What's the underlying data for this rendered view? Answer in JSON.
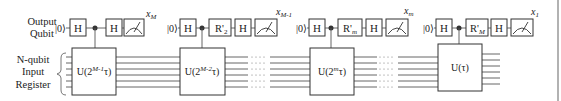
{
  "labels": {
    "output_qubit_line1": "Output",
    "output_qubit_line2": "Qubit",
    "register_line1": "N-qubit",
    "register_line2": "Input",
    "register_line3": "Register"
  },
  "stages": [
    {
      "ket": "|0⟩",
      "h1": "H",
      "rotation": "",
      "h2": "H",
      "unitary_base": "U(2",
      "unitary_exp": "M-1",
      "unitary_tail": "τ)",
      "measure_label": "x",
      "measure_sub": "M"
    },
    {
      "ket": "|0⟩",
      "h1": "H",
      "rotation": "R'",
      "rotation_sub": "2",
      "h2": "H",
      "unitary_base": "U(2",
      "unitary_exp": "M-2",
      "unitary_tail": "τ)",
      "measure_label": "x",
      "measure_sub": "M-1"
    },
    {
      "ket": "|0⟩",
      "h1": "H",
      "rotation": "R'",
      "rotation_sub": "m",
      "h2": "H",
      "unitary_base": "U(2",
      "unitary_exp": "m",
      "unitary_tail": "τ)",
      "measure_label": "x",
      "measure_sub": "m"
    },
    {
      "ket": "|0⟩",
      "h1": "H",
      "rotation": "R'",
      "rotation_sub": "M",
      "h2": "H",
      "unitary_base": "U(τ)",
      "unitary_exp": "",
      "unitary_tail": "",
      "measure_label": "x",
      "measure_sub": "1"
    }
  ],
  "ellipsis": ". . . .",
  "colors": {
    "stroke": "#333333",
    "wire": "#555555",
    "background": "#ffffff",
    "edge": "#999999"
  }
}
